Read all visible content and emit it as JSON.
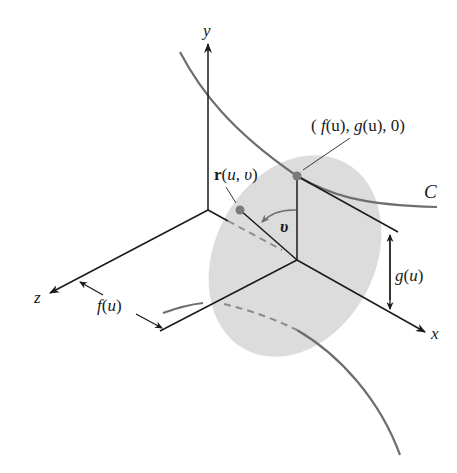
{
  "figure": {
    "colors": {
      "axis": "#1a1a1a",
      "curve": "#6e6e6e",
      "disk": "#d6d6d6",
      "point": "#7a7a7a",
      "background": "#ffffff"
    }
  },
  "axes": {
    "x_label": "x",
    "y_label": "y",
    "z_label": "z"
  },
  "labels": {
    "point_on_curve": "( f(u), g(u), 0)",
    "point_on_curve_parts": {
      "open": "( ",
      "f": "f",
      "fu": "(u), ",
      "g": "g",
      "gu": "(u), 0)"
    },
    "surface_point": {
      "r": "r",
      "args_open": "(",
      "u": "u",
      "comma": ", ",
      "v": "υ",
      "args_close": ")"
    },
    "angle": "υ",
    "curve": "C",
    "radius_height": {
      "g": "g",
      "paren_u": "(",
      "u": "u",
      "close": ")"
    },
    "offset_distance": {
      "f": "f",
      "paren_u": "(",
      "u": "u",
      "close": ")"
    }
  }
}
